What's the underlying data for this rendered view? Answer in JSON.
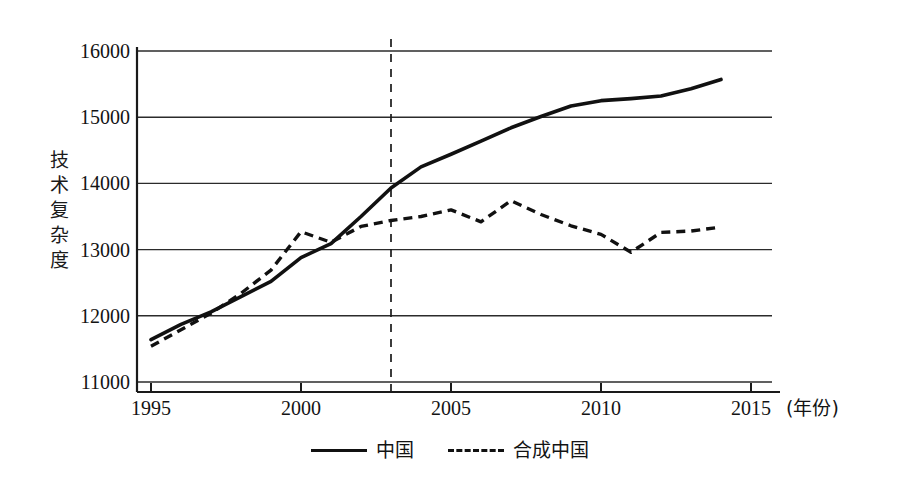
{
  "chart_data": {
    "type": "line",
    "title": "",
    "xlabel": "(年份)",
    "ylabel": "技术复杂度",
    "x": [
      1995,
      1996,
      1997,
      1998,
      1999,
      2000,
      2001,
      2002,
      2003,
      2004,
      2005,
      2006,
      2007,
      2008,
      2009,
      2010,
      2011,
      2012,
      2013,
      2014
    ],
    "xlim": [
      1995,
      2015
    ],
    "ylim": [
      11000,
      16000
    ],
    "xticks": [
      1995,
      2000,
      2005,
      2010,
      2015
    ],
    "yticks": [
      11000,
      12000,
      13000,
      14000,
      15000,
      16000
    ],
    "ytick_labels": [
      "11000",
      "12000",
      "13000",
      "14000",
      "15000",
      "16000"
    ],
    "xtick_labels": [
      "1995",
      "2000",
      "2005",
      "2010",
      "2015"
    ],
    "grid": "horizontal",
    "legend_position": "bottom-center",
    "annotations": [
      {
        "type": "vline",
        "x": 2003,
        "style": "dashed",
        "label": ""
      }
    ],
    "series": [
      {
        "name": "中国",
        "style": "solid",
        "color": "#111111",
        "values": [
          11640,
          11870,
          12060,
          12290,
          12520,
          12880,
          13090,
          13500,
          13930,
          14250,
          14440,
          14640,
          14840,
          15010,
          15170,
          15250,
          15280,
          15320,
          15430,
          15570
        ]
      },
      {
        "name": "合成中国",
        "style": "dashed",
        "color": "#111111",
        "values": [
          11540,
          11790,
          12040,
          12340,
          12690,
          13270,
          13110,
          13350,
          13440,
          13500,
          13600,
          13420,
          13740,
          13530,
          13360,
          13230,
          12960,
          13260,
          13280,
          13340
        ]
      }
    ]
  },
  "axis": {
    "y_title_chars": [
      "技",
      "术",
      "复",
      "杂",
      "度"
    ]
  },
  "legend": {
    "items": [
      {
        "label": "中国",
        "swatch": "solid-line-swatch"
      },
      {
        "label": "合成中国",
        "swatch": "dashed-line-swatch"
      }
    ]
  }
}
